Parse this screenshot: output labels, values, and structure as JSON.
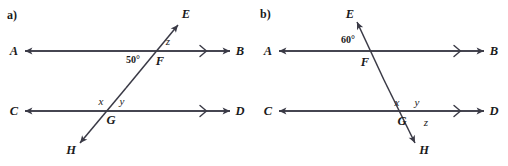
{
  "figure": {
    "type": "geometry-diagram",
    "stroke_color": "#3a3a46",
    "text_color": "#1a1a1a",
    "background_color": "#ffffff"
  },
  "panels": [
    {
      "id": "a",
      "label": "a)",
      "lines": [
        {
          "name": "line-ab",
          "from_label": "A",
          "to_label": "B",
          "orientation": "horizontal",
          "parallel_marks": 1
        },
        {
          "name": "line-cd",
          "from_label": "C",
          "to_label": "D",
          "orientation": "horizontal",
          "parallel_marks": 1
        },
        {
          "name": "transversal-eh",
          "from_label": "H",
          "to_label": "E",
          "orientation": "transversal"
        }
      ],
      "points": [
        {
          "name": "point-a",
          "label": "A",
          "x": 14,
          "y": 51
        },
        {
          "name": "point-b",
          "label": "B",
          "x": 240,
          "y": 51
        },
        {
          "name": "point-c",
          "label": "C",
          "x": 14,
          "y": 111
        },
        {
          "name": "point-d",
          "label": "D",
          "x": 240,
          "y": 111
        },
        {
          "name": "point-e",
          "label": "E",
          "x": 186,
          "y": 14
        },
        {
          "name": "point-h",
          "label": "H",
          "x": 71,
          "y": 150
        },
        {
          "name": "intersection-f",
          "label": "F",
          "x": 160,
          "y": 61
        },
        {
          "name": "intersection-g",
          "label": "G",
          "x": 111,
          "y": 120
        }
      ],
      "angles": [
        {
          "name": "angle-50-degrees",
          "label": "50°",
          "x": 133,
          "y": 60,
          "kind": "measure"
        },
        {
          "name": "angle-z",
          "label": "z",
          "x": 168,
          "y": 41,
          "kind": "variable"
        },
        {
          "name": "angle-x",
          "label": "x",
          "x": 101,
          "y": 101,
          "kind": "variable"
        },
        {
          "name": "angle-y",
          "label": "y",
          "x": 122,
          "y": 101,
          "kind": "variable"
        }
      ]
    },
    {
      "id": "b",
      "label": "b)",
      "lines": [
        {
          "name": "line-ab",
          "from_label": "A",
          "to_label": "B",
          "orientation": "horizontal",
          "parallel_marks": 1
        },
        {
          "name": "line-cd",
          "from_label": "C",
          "to_label": "D",
          "orientation": "horizontal",
          "parallel_marks": 1
        },
        {
          "name": "transversal-eh",
          "from_label": "E",
          "to_label": "H",
          "orientation": "transversal"
        }
      ],
      "points": [
        {
          "name": "point-a",
          "label": "A",
          "x": 14,
          "y": 51
        },
        {
          "name": "point-b",
          "label": "B",
          "x": 240,
          "y": 51
        },
        {
          "name": "point-c",
          "label": "C",
          "x": 14,
          "y": 111
        },
        {
          "name": "point-d",
          "label": "D",
          "x": 240,
          "y": 111
        },
        {
          "name": "point-e",
          "label": "E",
          "x": 96,
          "y": 14
        },
        {
          "name": "point-h",
          "label": "H",
          "x": 170,
          "y": 150
        },
        {
          "name": "intersection-f",
          "label": "F",
          "x": 111,
          "y": 62
        },
        {
          "name": "intersection-g",
          "label": "G",
          "x": 148,
          "y": 121
        }
      ],
      "angles": [
        {
          "name": "angle-60-degrees",
          "label": "60°",
          "x": 94,
          "y": 40,
          "kind": "measure"
        },
        {
          "name": "angle-x",
          "label": "x",
          "x": 143,
          "y": 102,
          "kind": "variable"
        },
        {
          "name": "angle-y",
          "label": "y",
          "x": 163,
          "y": 102,
          "kind": "variable"
        },
        {
          "name": "angle-z",
          "label": "z",
          "x": 172,
          "y": 122,
          "kind": "variable"
        }
      ]
    }
  ]
}
